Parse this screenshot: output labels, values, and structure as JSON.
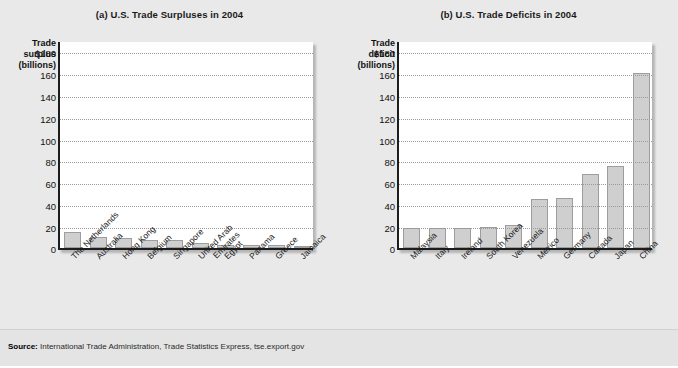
{
  "figure": {
    "background": "#e9e9e9",
    "bar_fill": "#cfcfcf",
    "bar_stroke": "#9d9d9d",
    "axis_color": "#1d1d1d",
    "grid_color": "#9a9a9a"
  },
  "footer": {
    "source_label": "Source:",
    "source_text": " International Trade Administration, Trade Statistics Express, tse.export.gov"
  },
  "chart_data": [
    {
      "type": "bar",
      "panel": "a",
      "title": "(a) U.S. Trade Surpluses in 2004",
      "ylabel_lines": [
        "Trade",
        "surplus",
        "(billions)"
      ],
      "ylabel": "Trade surplus (billions)",
      "xlabel": "",
      "ylim": [
        0,
        190
      ],
      "yticks": [
        20,
        40,
        60,
        80,
        100,
        120,
        140,
        160,
        180
      ],
      "ytick_labels": [
        "20",
        "40",
        "60",
        "80",
        "100",
        "120",
        "140",
        "160",
        "$180"
      ],
      "grid": true,
      "legend": "none",
      "categories": [
        "The Netherlands",
        "Australia",
        "Hong Kong",
        "Belgium",
        "Singapore",
        "United Arab Emirates",
        "Egypt",
        "Panama",
        "Greece",
        "Jamaica"
      ],
      "values": [
        15,
        10,
        9,
        7,
        7,
        5,
        3,
        3,
        3,
        2
      ]
    },
    {
      "type": "bar",
      "panel": "b",
      "title": "(b) U.S. Trade Deficits in 2004",
      "ylabel_lines": [
        "Trade",
        "deficit",
        "(billions)"
      ],
      "ylabel": "Trade deficit (billions)",
      "xlabel": "",
      "ylim": [
        0,
        190
      ],
      "yticks": [
        20,
        40,
        60,
        80,
        100,
        120,
        140,
        160,
        180
      ],
      "ytick_labels": [
        "20",
        "40",
        "60",
        "80",
        "100",
        "120",
        "140",
        "160",
        "$180"
      ],
      "grid": true,
      "legend": "none",
      "categories": [
        "Malaysia",
        "Italy",
        "Ireland",
        "South Korea",
        "Venezuela",
        "Mexico",
        "Germany",
        "Canada",
        "Japan",
        "China"
      ],
      "values": [
        18,
        18,
        18,
        19,
        21,
        45,
        46,
        68,
        75,
        160
      ]
    }
  ]
}
